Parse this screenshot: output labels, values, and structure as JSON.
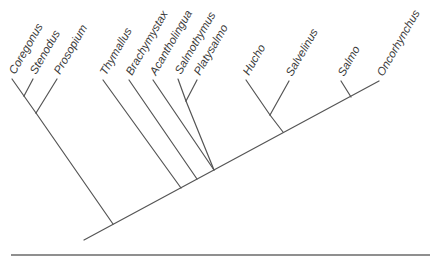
{
  "diagram": {
    "type": "phylogenetic-tree",
    "colors": {
      "branch": "#555555",
      "label": "#3a3a3a",
      "rule": "#6a6a6a",
      "background": "#ffffff"
    },
    "taxa": [
      {
        "id": "coregonus",
        "label": "Coregonus",
        "tip": [
          12,
          79
        ]
      },
      {
        "id": "stenodus",
        "label": "Stenodus",
        "tip": [
          33,
          79
        ]
      },
      {
        "id": "prosopium",
        "label": "Prosopium",
        "tip": [
          57,
          79
        ]
      },
      {
        "id": "thymallus",
        "label": "Thymallus",
        "tip": [
          103,
          80
        ]
      },
      {
        "id": "brachymystax",
        "label": "Brachymystax",
        "tip": [
          129,
          80
        ]
      },
      {
        "id": "acantholingua",
        "label": "Acantholingua",
        "tip": [
          153,
          80
        ]
      },
      {
        "id": "salmothymus",
        "label": "Salmothymus",
        "tip": [
          178,
          79
        ]
      },
      {
        "id": "platysalmo",
        "label": "Platysalmo",
        "tip": [
          197,
          80
        ]
      },
      {
        "id": "hucho",
        "label": "Hucho",
        "tip": [
          246,
          80
        ]
      },
      {
        "id": "salvelinus",
        "label": "Salvelinus",
        "tip": [
          289,
          81
        ]
      },
      {
        "id": "salmo",
        "label": "Salmo",
        "tip": [
          341,
          81
        ]
      },
      {
        "id": "oncorhynchus",
        "label": "Oncorhynchus",
        "tip": [
          379,
          81
        ]
      }
    ],
    "clades": [
      {
        "members": [
          "Coregonus",
          "Stenodus"
        ]
      },
      {
        "members": [
          "Coregonus",
          "Stenodus",
          "Prosopium"
        ]
      },
      {
        "members": [
          "Salmothymus",
          "Platysalmo"
        ]
      },
      {
        "members": [
          "Acantholingua",
          "Salmothymus",
          "Platysalmo"
        ]
      },
      {
        "members": [
          "Hucho",
          "Salvelinus"
        ]
      },
      {
        "members": [
          "Salmo",
          "Oncorhynchus"
        ]
      }
    ]
  }
}
